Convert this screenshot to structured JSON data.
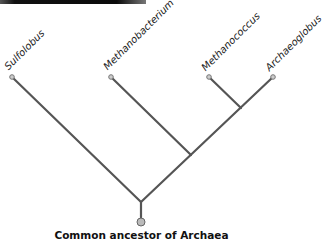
{
  "figure": {
    "taxa": [
      {
        "name": "Sulfolobus"
      },
      {
        "name": "Methanobacterium"
      },
      {
        "name": "Methanococcus"
      },
      {
        "name": "Archaeoglobus"
      }
    ],
    "root_label": "Common ancestor of Archaea",
    "colors": {
      "branch": "#555555",
      "node_fill": "#bbbbbb",
      "node_stroke": "#666666"
    }
  }
}
